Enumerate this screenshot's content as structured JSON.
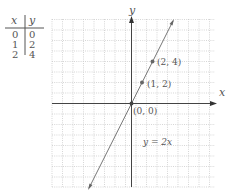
{
  "table": {
    "headers": [
      "x",
      "y"
    ],
    "rows": [
      [
        "0",
        "0"
      ],
      [
        "1",
        "2"
      ],
      [
        "2",
        "4"
      ]
    ]
  },
  "graph": {
    "x_axis_label": "x",
    "y_axis_label": "y",
    "equation_label": "y = 2x",
    "points": [
      {
        "label": "(0, 0)",
        "x": 0,
        "y": 0
      },
      {
        "label": "(1, 2)",
        "x": 1,
        "y": 2
      },
      {
        "label": "(2, 4)",
        "x": 2,
        "y": 4
      }
    ],
    "line_color": "#777777",
    "grid_color": "#bbbbbb",
    "axis_color": "#555555"
  }
}
